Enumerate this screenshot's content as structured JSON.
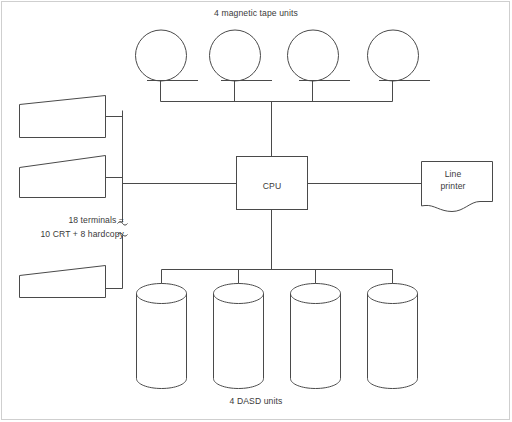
{
  "diagram": {
    "title_top": "4 magnetic tape units",
    "title_bottom": "4 DASD units",
    "cpu": {
      "label": "CPU"
    },
    "printer": {
      "label_line1": "Line",
      "label_line2": "printer"
    },
    "terminals": {
      "note_line1": "18 terminals =",
      "note_line2": "10 CRT + 8 hardcopy",
      "count_total": 18,
      "count_crt": 10,
      "count_hardcopy": 8,
      "drawn_units": 3
    },
    "tape_units": {
      "count": 4,
      "icon": "tape-reel-icon"
    },
    "dasd_units": {
      "count": 4,
      "icon": "disk-cylinder-icon"
    },
    "colors": {
      "line": "#4a4a4a",
      "frame": "#cfcfcf",
      "text": "#3a3a3a",
      "background": "#ffffff"
    }
  }
}
